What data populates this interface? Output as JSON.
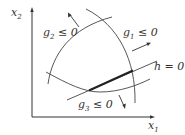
{
  "diagram": {
    "type": "constraint-feasible-region",
    "axes": {
      "x": {
        "var": "x",
        "sub": "1"
      },
      "y": {
        "var": "x",
        "sub": "2"
      }
    },
    "constraints": [
      {
        "name": "g",
        "sub": "2",
        "rel": " ≤ 0",
        "kind": "inequality"
      },
      {
        "name": "g",
        "sub": "1",
        "rel": " ≤ 0",
        "kind": "inequality"
      },
      {
        "name": "g",
        "sub": "3",
        "rel": " ≤ 0",
        "kind": "inequality"
      },
      {
        "name": "h",
        "sub": "",
        "rel": " = 0",
        "kind": "equality"
      }
    ],
    "colors": {
      "line": "#444444",
      "text": "#333333",
      "feasible": "#222222"
    }
  }
}
